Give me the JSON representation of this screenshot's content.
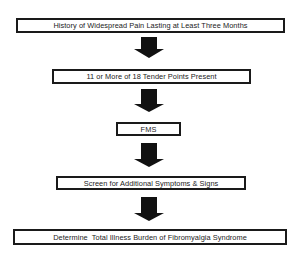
{
  "diagram": {
    "type": "flowchart",
    "direction": "top-to-bottom",
    "colors": {
      "box_border": "#1a1a1a",
      "arrow_fill": "#111111",
      "background": "#ffffff",
      "text": "#222222"
    },
    "nodes": [
      {
        "id": "n1",
        "label": "History of Widespread Pain Lasting at Least Three Months"
      },
      {
        "id": "n2",
        "label": "11 or More of 18 Tender Points Present"
      },
      {
        "id": "n3",
        "label": "FMS"
      },
      {
        "id": "n4",
        "label": "Screen for Additional Symptoms & Signs"
      },
      {
        "id": "n5",
        "label": "Determine  Total Illness Burden of Fibromyalgia Syndrome"
      }
    ],
    "edges": [
      {
        "from": "n1",
        "to": "n2",
        "icon": "down-arrow-icon"
      },
      {
        "from": "n2",
        "to": "n3",
        "icon": "down-arrow-icon"
      },
      {
        "from": "n3",
        "to": "n4",
        "icon": "down-arrow-icon"
      },
      {
        "from": "n4",
        "to": "n5",
        "icon": "down-arrow-icon"
      }
    ]
  }
}
